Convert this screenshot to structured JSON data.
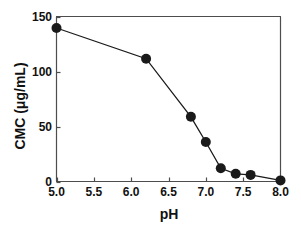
{
  "chart_data": {
    "type": "line",
    "title": "",
    "xlabel": "pH",
    "ylabel": "CMC (μg/mL)",
    "xlim": [
      5.0,
      8.0
    ],
    "ylim": [
      0,
      150
    ],
    "xticks": [
      "5.0",
      "5.5",
      "6.0",
      "6.5",
      "7.0",
      "7.5",
      "8.0"
    ],
    "xtick_values": [
      5.0,
      5.5,
      6.0,
      6.5,
      7.0,
      7.5,
      8.0
    ],
    "yticks": [
      "0",
      "50",
      "100",
      "150"
    ],
    "ytick_values": [
      0,
      50,
      100,
      150
    ],
    "grid": false,
    "legend": null,
    "marker": "filled-circle",
    "marker_color": "#1a1a1a",
    "line_color": "#1a1a1a",
    "x": [
      5.0,
      6.2,
      6.8,
      7.0,
      7.2,
      7.4,
      7.6,
      8.0
    ],
    "y": [
      140,
      112,
      59,
      36,
      12,
      7,
      6,
      1
    ],
    "points": [
      {
        "x": 5.0,
        "y": 140
      },
      {
        "x": 6.2,
        "y": 112
      },
      {
        "x": 6.8,
        "y": 59
      },
      {
        "x": 7.0,
        "y": 36
      },
      {
        "x": 7.2,
        "y": 12
      },
      {
        "x": 7.4,
        "y": 7
      },
      {
        "x": 7.6,
        "y": 6
      },
      {
        "x": 8.0,
        "y": 1
      }
    ]
  },
  "axis_labels": {
    "x_title": "pH",
    "y_title": "CMC (μg/mL)"
  },
  "ticks": {
    "y": [
      "0",
      "50",
      "100",
      "150"
    ],
    "x": [
      "5.0",
      "5.5",
      "6.0",
      "6.5",
      "7.0",
      "7.5",
      "8.0"
    ]
  },
  "colors": {
    "axis": "#4d4d4d",
    "marker": "#1a1a1a",
    "line": "#1a1a1a",
    "text": "#111111",
    "background": "#ffffff"
  }
}
